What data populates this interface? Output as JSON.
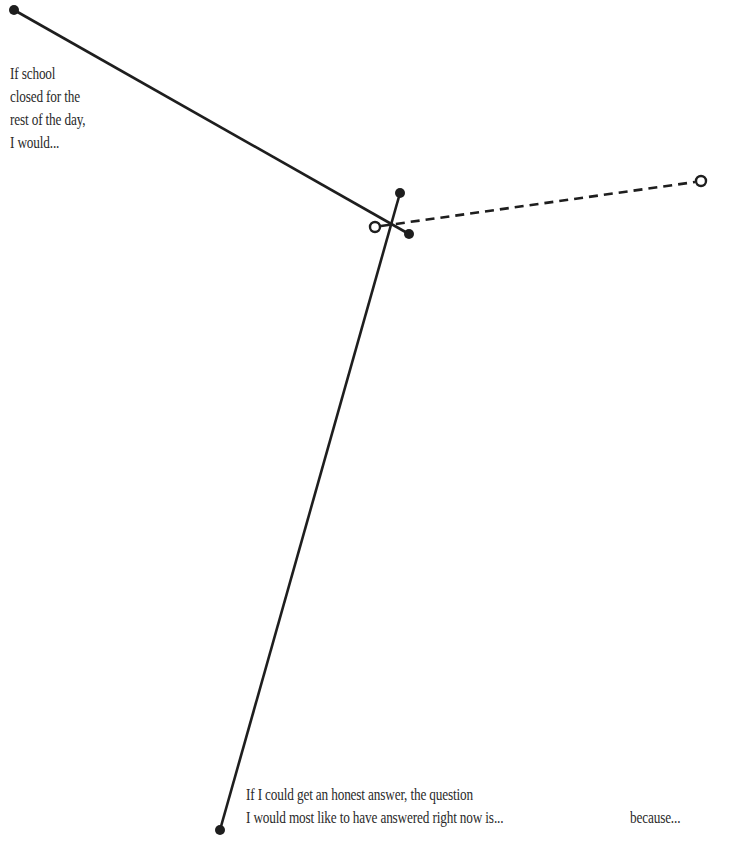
{
  "prompts": {
    "school_closed": {
      "lines": [
        "If school",
        "closed for the",
        "rest of the day,",
        "I would..."
      ]
    },
    "honest_answer": {
      "lines": [
        "If I could get an honest answer, the question",
        "I would most like to have answered right now is..."
      ]
    },
    "because": {
      "text": "because..."
    }
  },
  "colors": {
    "line": "#1e1e1e",
    "text": "#2a2a2a",
    "background": "#ffffff"
  }
}
